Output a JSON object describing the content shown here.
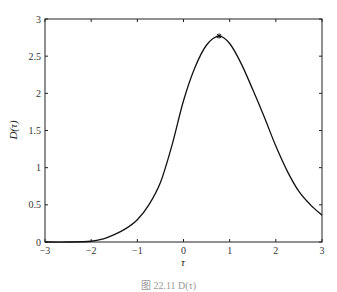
{
  "chart_data": {
    "type": "line",
    "title": "",
    "xlabel": "τ",
    "ylabel": "D(τ)",
    "xlim": [
      -3,
      3
    ],
    "ylim": [
      0,
      3
    ],
    "xticks": [
      -3,
      -2,
      -1,
      0,
      1,
      2,
      3
    ],
    "xtick_labels": [
      "−3",
      "−2",
      "−1",
      "0",
      "1",
      "2",
      "3"
    ],
    "yticks": [
      0,
      0.5,
      1,
      1.5,
      2,
      2.5,
      3
    ],
    "ytick_labels": [
      "0",
      "0.5",
      "1",
      "1.5",
      "2",
      "2.5",
      "3"
    ],
    "grid": false,
    "series": [
      {
        "name": "D(τ)",
        "color": "#111111",
        "x": [
          -3,
          -2.5,
          -2,
          -1.75,
          -1.5,
          -1.25,
          -1,
          -0.75,
          -0.5,
          -0.25,
          0,
          0.25,
          0.5,
          0.77,
          1,
          1.25,
          1.5,
          1.75,
          2,
          2.25,
          2.5,
          2.75,
          3
        ],
        "y": [
          0,
          0,
          0.01,
          0.04,
          0.1,
          0.18,
          0.3,
          0.5,
          0.8,
          1.3,
          1.9,
          2.35,
          2.65,
          2.77,
          2.67,
          2.4,
          2.05,
          1.68,
          1.29,
          0.95,
          0.68,
          0.5,
          0.36
        ]
      }
    ],
    "annotations": [
      {
        "type": "marker",
        "symbol": "*",
        "x": 0.77,
        "y": 2.77,
        "label": "peak"
      }
    ]
  },
  "caption": "图 22.11  D(τ)"
}
